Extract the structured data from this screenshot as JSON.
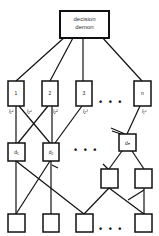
{
  "diagram": {
    "type": "pandemonium-architecture",
    "top": {
      "label_line1": "decision",
      "label_line2": "demon"
    },
    "cognitive_demons": [
      {
        "label": "1"
      },
      {
        "label": "2"
      },
      {
        "label": "3"
      },
      {
        "label": "n"
      }
    ],
    "ellipsis": "• • •",
    "connection_labels": [
      {
        "id": "l11",
        "text": "l₁¹"
      },
      {
        "id": "l21",
        "text": "l₂¹"
      },
      {
        "id": "l22",
        "text": "l₂²"
      },
      {
        "id": "l23",
        "text": "l₂³"
      },
      {
        "id": "l1n",
        "text": "l₁ⁿ"
      }
    ],
    "feature_demons": [
      {
        "label": "d₁"
      },
      {
        "label": "d₂"
      },
      {
        "label": "dₙ"
      }
    ],
    "bottom_ellipsis": "• • •",
    "mid_ellipsis": "• • •"
  }
}
